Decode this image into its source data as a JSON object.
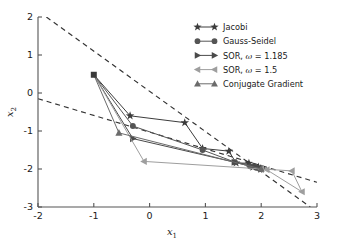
{
  "chart_data": {
    "type": "line",
    "title": "",
    "xlabel": "x_1",
    "ylabel": "x_2",
    "xlabel_base": "x",
    "xlabel_sub": "1",
    "ylabel_base": "x",
    "ylabel_sub": "2",
    "xlim": [
      -2,
      3
    ],
    "ylim": [
      -3,
      2
    ],
    "xticks": [
      -2,
      -1,
      0,
      1,
      2,
      3
    ],
    "xtick_labels": [
      "-2",
      "-1",
      "0",
      "1",
      "2",
      "3"
    ],
    "yticks": [
      -3,
      -2,
      -1,
      0,
      1,
      2
    ],
    "ytick_labels": [
      "-3",
      "-2",
      "-1",
      "0",
      "1",
      "2"
    ],
    "grid": false,
    "legend_position": "upper right",
    "start_point": [
      -1.0,
      0.48
    ],
    "start_marker": "square",
    "start_color": "#3a3a3a",
    "constraint_lines": [
      {
        "name": "equation-1",
        "points": [
          [
            -1.85,
            2.0
          ],
          [
            2.88,
            -3.0
          ]
        ],
        "style": "dashed",
        "color": "#333333"
      },
      {
        "name": "equation-2",
        "points": [
          [
            -2.0,
            -0.15
          ],
          [
            3.0,
            -2.35
          ]
        ],
        "style": "dashed",
        "color": "#333333"
      }
    ],
    "series": [
      {
        "name": "Jacobi",
        "label": "Jacobi",
        "marker": "star",
        "color": "#3c3c3c",
        "linewidth": 1.0,
        "points": [
          [
            -1.0,
            0.48
          ],
          [
            -0.35,
            -0.6
          ],
          [
            0.63,
            -0.78
          ],
          [
            0.95,
            -1.46
          ],
          [
            1.42,
            -1.53
          ],
          [
            1.55,
            -1.84
          ],
          [
            1.78,
            -1.85
          ],
          [
            1.85,
            -1.95
          ],
          [
            1.95,
            -1.95
          ],
          [
            1.99,
            -1.99
          ],
          [
            2.0,
            -2.0
          ]
        ]
      },
      {
        "name": "Gauss-Seidel",
        "label": "Gauss-Seidel",
        "marker": "circle",
        "color": "#555555",
        "linewidth": 1.0,
        "points": [
          [
            -1.0,
            0.48
          ],
          [
            -0.3,
            -0.87
          ],
          [
            0.95,
            -1.5
          ],
          [
            1.53,
            -1.82
          ],
          [
            1.8,
            -1.93
          ],
          [
            1.92,
            -1.97
          ],
          [
            1.97,
            -1.99
          ],
          [
            2.0,
            -2.0
          ]
        ]
      },
      {
        "name": "SOR, omega = 1.185",
        "label": "SOR, ",
        "label_omega": "ω",
        "label_value": " = 1.185",
        "marker": "triangle-right",
        "color": "#4a4a4a",
        "linewidth": 1.0,
        "points": [
          [
            -1.0,
            0.48
          ],
          [
            -0.3,
            -1.2
          ],
          [
            1.52,
            -1.82
          ],
          [
            1.9,
            -1.92
          ],
          [
            2.02,
            -1.98
          ],
          [
            2.0,
            -2.0
          ]
        ]
      },
      {
        "name": "SOR, omega = 1.5",
        "label": "SOR, ",
        "label_omega": "ω",
        "label_value": " = 1.5",
        "marker": "triangle-left",
        "color": "#9e9e9e",
        "linewidth": 1.0,
        "points": [
          [
            -1.0,
            0.48
          ],
          [
            -0.1,
            -1.8
          ],
          [
            2.55,
            -2.05
          ],
          [
            2.73,
            -2.6
          ],
          [
            2.1,
            -2.02
          ],
          [
            2.0,
            -2.0
          ]
        ]
      },
      {
        "name": "Conjugate Gradient",
        "label": "Conjugate Gradient",
        "marker": "triangle-up",
        "color": "#6b6b6b",
        "linewidth": 1.0,
        "points": [
          [
            -1.0,
            0.48
          ],
          [
            -0.55,
            -1.05
          ],
          [
            2.0,
            -2.0
          ]
        ]
      }
    ]
  },
  "legend": {
    "entries": [
      {
        "label": "Jacobi",
        "marker": "star-icon"
      },
      {
        "label": "Gauss-Seidel",
        "marker": "circle-icon"
      },
      {
        "label": "SOR, ",
        "omega": "ω",
        "value": " = 1.185",
        "marker": "triangle-right-icon"
      },
      {
        "label": "SOR, ",
        "omega": "ω",
        "value": " = 1.5",
        "marker": "triangle-left-icon"
      },
      {
        "label": "Conjugate Gradient",
        "marker": "triangle-up-icon"
      }
    ]
  }
}
